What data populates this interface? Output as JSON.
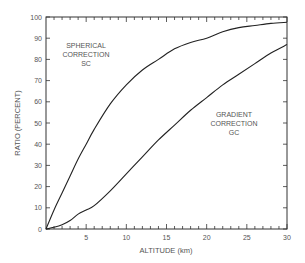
{
  "chart_data": {
    "type": "line",
    "title": "",
    "xlabel": "ALTITUDE (km)",
    "ylabel": "RATIO (PERCENT)",
    "xlim": [
      0,
      30
    ],
    "ylim": [
      0,
      100
    ],
    "x_ticks": [
      5,
      10,
      15,
      20,
      25,
      30
    ],
    "y_ticks": [
      0,
      10,
      20,
      30,
      40,
      50,
      60,
      70,
      80,
      90,
      100
    ],
    "grid": false,
    "legend": "none (inline labels)",
    "x": [
      0,
      1,
      2,
      3,
      4,
      5,
      6,
      8,
      10,
      12,
      14,
      16,
      18,
      20,
      22,
      24,
      26,
      28,
      30
    ],
    "series": [
      {
        "name": "SPHERICAL CORRECTION SC",
        "label_lines": [
          "SPHERICAL",
          "CORRECTION",
          "SC"
        ],
        "values": [
          0,
          9,
          17,
          25,
          33,
          40,
          47,
          59,
          68,
          75,
          80,
          85,
          88,
          90,
          93,
          95,
          96,
          97,
          97.5
        ]
      },
      {
        "name": "GRADIENT CORRECTION GC",
        "label_lines": [
          "GRADIENT",
          "CORRECTION",
          "GC"
        ],
        "values": [
          0,
          0.8,
          2,
          4,
          7,
          9,
          11,
          18,
          26,
          34,
          42,
          49,
          56,
          62,
          68,
          73,
          78,
          83,
          87
        ]
      }
    ]
  }
}
